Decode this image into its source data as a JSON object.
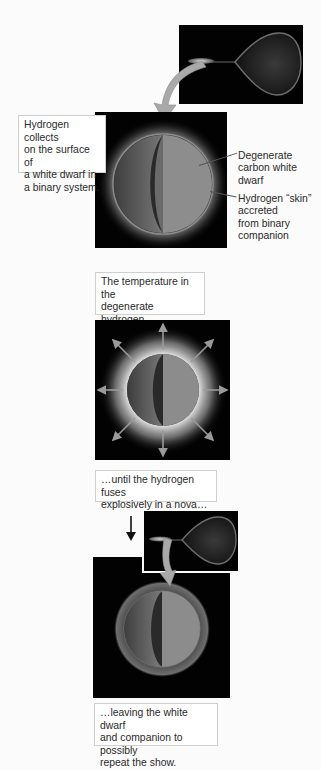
{
  "diagram": {
    "stages": [
      {
        "id": "accretion",
        "caption": "Hydrogen collects on the surface of a white dwarf in a binary system.",
        "caption_lines": [
          "Hydrogen collects",
          "on the surface of",
          "a white dwarf in",
          "a binary system."
        ]
      },
      {
        "id": "heating",
        "caption": "The temperature in the degenerate hydrogen skin climbs…",
        "caption_lines": [
          "The temperature in the",
          "degenerate hydrogen",
          "skin climbs…"
        ]
      },
      {
        "id": "nova",
        "caption": "…until the hydrogen fuses explosively in a nova…",
        "caption_lines": [
          "…until the hydrogen fuses",
          "explosively in a nova…"
        ]
      },
      {
        "id": "repeat",
        "caption": "…leaving the white dwarf and companion to possibly repeat the show.",
        "caption_lines": [
          "…leaving the white dwarf",
          "and companion to possibly",
          "repeat the show."
        ]
      }
    ],
    "labels": {
      "white_dwarf": [
        "Degenerate",
        "carbon white",
        "dwarf"
      ],
      "hydrogen_skin": [
        "Hydrogen “skin”",
        "accreted",
        "from binary",
        "companion"
      ]
    },
    "colors": {
      "panel_bg": "#020202",
      "arrow": "#a9a9a9",
      "dwarf_face": "#8b8b8b",
      "dwarf_shadow": "#5c5c5c",
      "glow": "#bdbdbd",
      "caption_border": "#cfcfcf"
    },
    "icons": [
      "curved-arrow-icon",
      "down-arrow-icon",
      "burst-arrow-icon"
    ]
  }
}
